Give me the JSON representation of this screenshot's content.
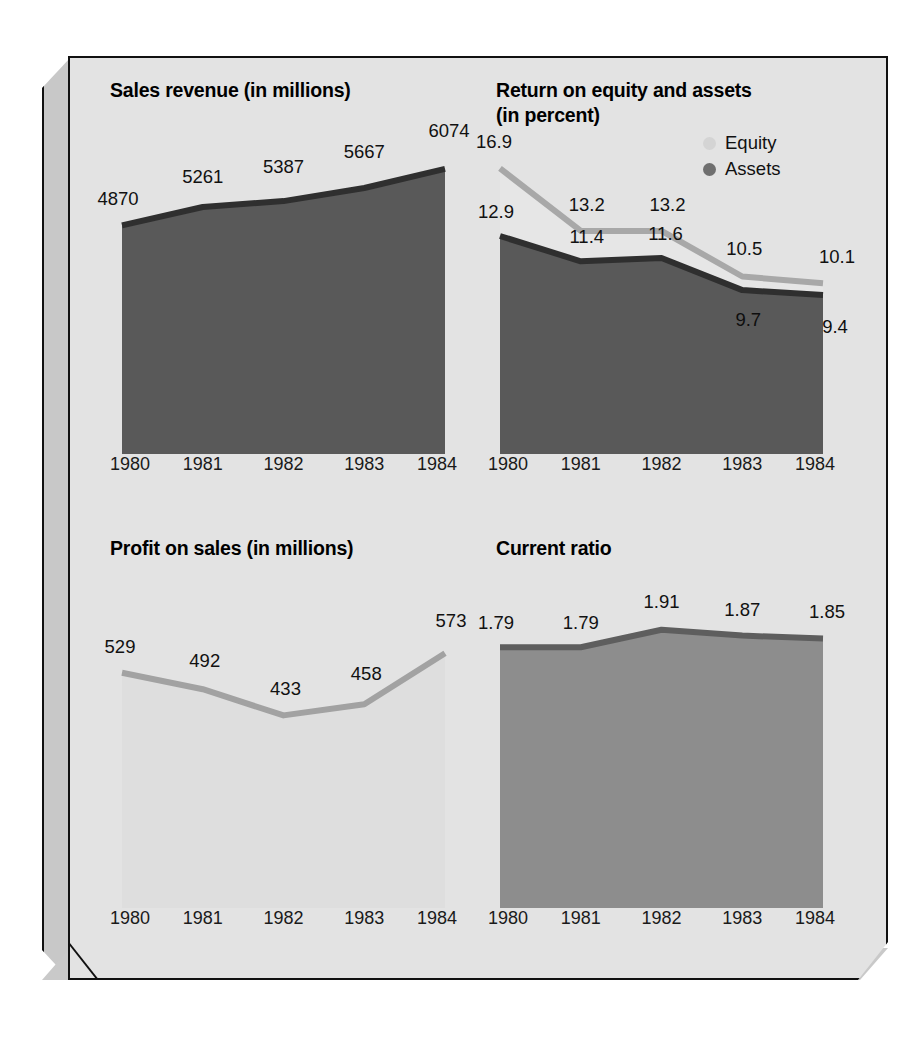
{
  "figure": {
    "background": "#e3e3e3",
    "frame_color": "#111111",
    "bevel_color": "#c8c8c8"
  },
  "colors": {
    "dark_gray": "#595959",
    "medium_gray": "#8d8d8d",
    "light_gray": "#d9d9d9",
    "very_light_gray": "#dedede",
    "outline_dark": "#3a3a3a",
    "text": "#111111"
  },
  "legend": {
    "items": [
      {
        "label": "Equity",
        "marker": "circle",
        "color": "#d4d4d4"
      },
      {
        "label": "Assets",
        "marker": "circle",
        "color": "#6f6f6f"
      }
    ]
  },
  "chart_data": [
    {
      "type": "area",
      "title": "Sales revenue (in millions)",
      "xlabel": "",
      "ylabel": "",
      "categories": [
        "1980",
        "1981",
        "1982",
        "1983",
        "1984"
      ],
      "values": [
        4870,
        5261,
        5387,
        5667,
        6074
      ],
      "labels": [
        "4870",
        "5261",
        "5387",
        "5667",
        "6074"
      ],
      "ylim": [
        0,
        7200
      ],
      "grid": false,
      "fill": "#595959",
      "line": "#2f2f2f"
    },
    {
      "type": "area",
      "title": "Return on equity and assets\n(in percent)",
      "xlabel": "",
      "ylabel": "",
      "categories": [
        "1980",
        "1981",
        "1982",
        "1983",
        "1984"
      ],
      "series": [
        {
          "name": "Equity",
          "values": [
            16.9,
            13.2,
            13.2,
            10.5,
            10.1
          ],
          "labels": [
            "16.9",
            "13.2",
            "13.2",
            "10.5",
            "10.1"
          ],
          "fill": "#e6e6e6",
          "line": "#a8a8a8"
        },
        {
          "name": "Assets",
          "values": [
            12.9,
            11.4,
            11.6,
            9.7,
            9.4
          ],
          "labels": [
            "12.9",
            "11.4",
            "11.6",
            "9.7",
            "9.4"
          ],
          "fill": "#595959",
          "line": "#2f2f2f"
        }
      ],
      "ylim": [
        0,
        20
      ],
      "grid": false,
      "legend_position": "top-right"
    },
    {
      "type": "area",
      "title": "Profit on sales (in millions)",
      "xlabel": "",
      "ylabel": "",
      "categories": [
        "1980",
        "1981",
        "1982",
        "1983",
        "1984"
      ],
      "values": [
        529,
        492,
        433,
        458,
        573
      ],
      "labels": [
        "529",
        "492",
        "433",
        "458",
        "573"
      ],
      "ylim": [
        0,
        760
      ],
      "grid": false,
      "fill": "#dedede",
      "line": "#a2a2a2"
    },
    {
      "type": "area",
      "title": "Current ratio",
      "xlabel": "",
      "ylabel": "",
      "categories": [
        "1980",
        "1981",
        "1982",
        "1983",
        "1984"
      ],
      "values": [
        1.79,
        1.79,
        1.91,
        1.87,
        1.85
      ],
      "labels": [
        "1.79",
        "1.79",
        "1.91",
        "1.87",
        "1.85"
      ],
      "ylim": [
        0,
        2.32
      ],
      "grid": false,
      "fill": "#8d8d8d",
      "line": "#5e5e5e"
    }
  ]
}
